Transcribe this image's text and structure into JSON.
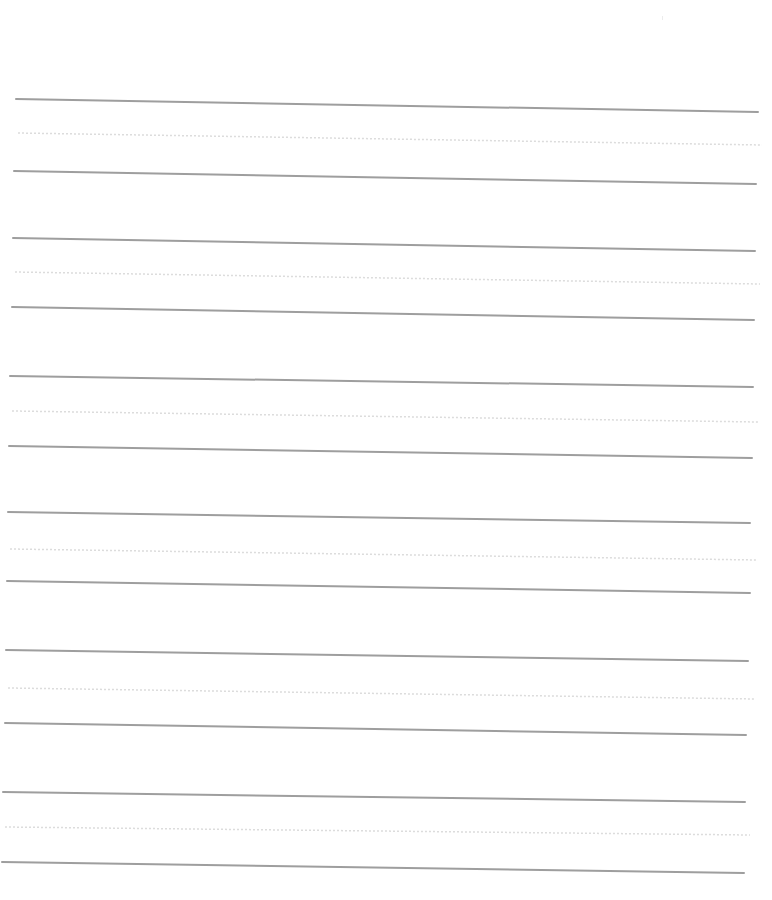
{
  "page": {
    "type": "handwriting-practice-sheet",
    "width": 772,
    "height": 900,
    "background": "#ffffff",
    "solid_line_color": "#9e9e9e",
    "solid_line_width": 2,
    "dotted_line_color": "#dcdcdc",
    "dotted_line_width": 1.5
  },
  "line_sets": [
    {
      "top": {
        "x1": 16,
        "y1": 99,
        "x2": 758,
        "y2": 112
      },
      "middle": {
        "x1": 18,
        "y1": 133,
        "x2": 762,
        "y2": 145
      },
      "bottom": {
        "x1": 14,
        "y1": 171,
        "x2": 756,
        "y2": 184
      }
    },
    {
      "top": {
        "x1": 13,
        "y1": 238,
        "x2": 755,
        "y2": 251
      },
      "middle": {
        "x1": 15,
        "y1": 272,
        "x2": 760,
        "y2": 284
      },
      "bottom": {
        "x1": 12,
        "y1": 307,
        "x2": 754,
        "y2": 320
      }
    },
    {
      "top": {
        "x1": 10,
        "y1": 376,
        "x2": 753,
        "y2": 387
      },
      "middle": {
        "x1": 12,
        "y1": 411,
        "x2": 758,
        "y2": 422
      },
      "bottom": {
        "x1": 9,
        "y1": 446,
        "x2": 752,
        "y2": 458
      }
    },
    {
      "top": {
        "x1": 8,
        "y1": 512,
        "x2": 750,
        "y2": 523
      },
      "middle": {
        "x1": 10,
        "y1": 549,
        "x2": 757,
        "y2": 560
      },
      "bottom": {
        "x1": 7,
        "y1": 581,
        "x2": 750,
        "y2": 593
      }
    },
    {
      "top": {
        "x1": 6,
        "y1": 650,
        "x2": 748,
        "y2": 661
      },
      "middle": {
        "x1": 8,
        "y1": 688,
        "x2": 755,
        "y2": 699
      },
      "bottom": {
        "x1": 5,
        "y1": 723,
        "x2": 746,
        "y2": 735
      }
    },
    {
      "top": {
        "x1": 3,
        "y1": 792,
        "x2": 745,
        "y2": 802
      },
      "middle": {
        "x1": 5,
        "y1": 827,
        "x2": 750,
        "y2": 835
      },
      "bottom": {
        "x1": 2,
        "y1": 862,
        "x2": 744,
        "y2": 873
      }
    }
  ]
}
